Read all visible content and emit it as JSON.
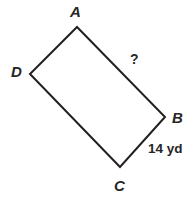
{
  "figure": {
    "type": "quadrilateral-diagram",
    "shape_name": "ABCD",
    "background_color": "#ffffff",
    "stroke_color": "#231f20",
    "stroke_width": 2,
    "width": 193,
    "height": 212,
    "vertices": [
      {
        "name": "A",
        "label": "A",
        "x": 77,
        "y": 27,
        "label_x": 70,
        "label_y": 4
      },
      {
        "name": "B",
        "label": "B",
        "x": 165,
        "y": 117,
        "label_x": 172,
        "label_y": 110
      },
      {
        "name": "C",
        "label": "C",
        "x": 120,
        "y": 167,
        "label_x": 114,
        "label_y": 178
      },
      {
        "name": "D",
        "label": "D",
        "x": 30,
        "y": 74,
        "label_x": 11,
        "label_y": 64
      }
    ],
    "edges": [
      {
        "name": "AB",
        "from": "A",
        "to": "B",
        "annotation": "?",
        "annotation_x": 130,
        "annotation_y": 52
      },
      {
        "name": "BC",
        "from": "B",
        "to": "C",
        "annotation": "14 yd",
        "annotation_x": 148,
        "annotation_y": 142
      },
      {
        "name": "CD",
        "from": "C",
        "to": "D",
        "annotation": "",
        "annotation_x": 0,
        "annotation_y": 0
      },
      {
        "name": "DA",
        "from": "D",
        "to": "A",
        "annotation": "",
        "annotation_x": 0,
        "annotation_y": 0
      }
    ],
    "labels": {
      "vertex_a": "A",
      "vertex_b": "B",
      "vertex_c": "C",
      "vertex_d": "D",
      "unknown_side": "?",
      "known_side": "14 yd"
    },
    "path_d": "M 77 27 L 165 117 L 120 167 L 30 74 Z"
  }
}
